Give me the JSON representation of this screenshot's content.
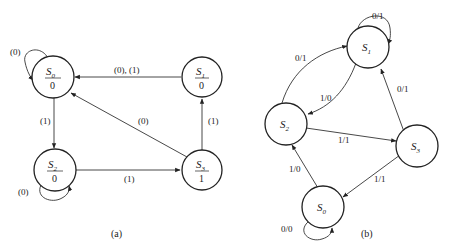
{
  "diagrams": [
    {
      "caption": "(a)",
      "type": "Moore",
      "states": [
        {
          "id": "S0",
          "name": "S",
          "sub": "0",
          "output": "0"
        },
        {
          "id": "S1",
          "name": "S",
          "sub": "1",
          "output": "0"
        },
        {
          "id": "S2",
          "name": "S",
          "sub": "2",
          "output": "0"
        },
        {
          "id": "S3",
          "name": "S",
          "sub": "3",
          "output": "1"
        }
      ],
      "transitions": [
        {
          "from": "S0",
          "to": "S0",
          "label": "(0)"
        },
        {
          "from": "S0",
          "to": "S2",
          "label": "(1)"
        },
        {
          "from": "S1",
          "to": "S0",
          "label": "(0), (1)"
        },
        {
          "from": "S2",
          "to": "S2",
          "label": "(0)"
        },
        {
          "from": "S2",
          "to": "S3",
          "label": "(1)"
        },
        {
          "from": "S3",
          "to": "S0",
          "label": "(0)"
        },
        {
          "from": "S3",
          "to": "S1",
          "label": "(1)"
        }
      ]
    },
    {
      "caption": "(b)",
      "type": "Mealy",
      "states": [
        {
          "id": "S0",
          "name": "S",
          "sub": "0"
        },
        {
          "id": "S1",
          "name": "S",
          "sub": "1"
        },
        {
          "id": "S2",
          "name": "S",
          "sub": "2"
        },
        {
          "id": "S3",
          "name": "S",
          "sub": "3"
        }
      ],
      "transitions": [
        {
          "from": "S1",
          "to": "S1",
          "label": "0/1"
        },
        {
          "from": "S2",
          "to": "S1",
          "label": "0/1"
        },
        {
          "from": "S1",
          "to": "S2",
          "label": "1/0"
        },
        {
          "from": "S3",
          "to": "S1",
          "label": "0/1"
        },
        {
          "from": "S2",
          "to": "S3",
          "label": "1/1"
        },
        {
          "from": "S0",
          "to": "S2",
          "label": "1/0"
        },
        {
          "from": "S3",
          "to": "S0",
          "label": "1/1"
        },
        {
          "from": "S0",
          "to": "S0",
          "label": "0/0"
        }
      ]
    }
  ]
}
